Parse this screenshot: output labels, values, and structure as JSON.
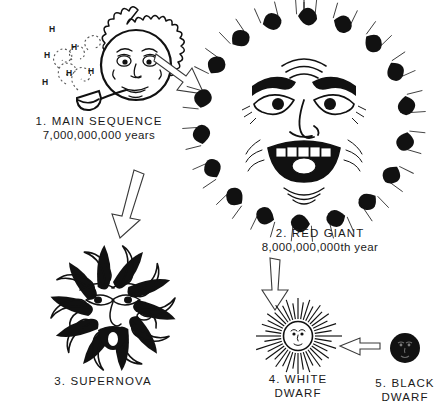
{
  "figure": {
    "background_color": "#ffffff",
    "ink_color": "#111111"
  },
  "stages": [
    {
      "id": "main-sequence",
      "number": "1.",
      "name": "MAIN SEQUENCE",
      "caption_line1": "1.  MAIN  SEQUENCE",
      "caption_line2": "7,000,000,000 years",
      "age_value": "7,000,000,000",
      "age_unit": "years",
      "art_description": "smiling-sun-with-pipe",
      "smoke_labels": [
        "H",
        "H",
        "H",
        "H",
        "H",
        "H"
      ]
    },
    {
      "id": "red-giant",
      "number": "2.",
      "name": "RED GIANT",
      "caption_line1": "2.  RED  GIANT",
      "caption_line2": "8,000,000,000th year",
      "age_value": "8,000,000,000th",
      "age_unit": "year",
      "art_description": "angry-screaming-giant-sun-face"
    },
    {
      "id": "supernova",
      "number": "3.",
      "name": "SUPERNOVA",
      "caption_line1": "3. SUPERNOVA",
      "caption_line2": "",
      "age_value": "",
      "age_unit": "",
      "art_description": "exploding-star-face-with-flames"
    },
    {
      "id": "white-dwarf",
      "number": "4.",
      "name": "WHITE DWARF",
      "caption_line1": "4.  WHITE",
      "caption_line2": "DWARF",
      "age_value": "",
      "age_unit": "",
      "art_description": "small-radiating-sun-with-face"
    },
    {
      "id": "black-dwarf",
      "number": "5.",
      "name": "BLACK DWARF",
      "caption_line1": "5.  BLACK",
      "caption_line2": "DWARF",
      "age_value": "",
      "age_unit": "",
      "art_description": "small-black-disc-with-face"
    }
  ],
  "arrows": [
    {
      "id": "arrow-main-to-giant",
      "from": "main-sequence",
      "to": "red-giant",
      "direction": "down-right"
    },
    {
      "id": "arrow-giant-to-supernova",
      "from": "red-giant",
      "to": "supernova",
      "direction": "down"
    },
    {
      "id": "arrow-giant-to-whitedwarf",
      "from": "red-giant",
      "to": "white-dwarf",
      "direction": "down"
    },
    {
      "id": "arrow-whitedwarf-to-blackdwarf",
      "from": "white-dwarf",
      "to": "black-dwarf",
      "direction": "right"
    }
  ]
}
